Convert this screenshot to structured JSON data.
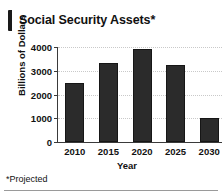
{
  "title": "Social Security Assets*",
  "footnote": "*Projected",
  "colors": {
    "bar": "#2b2b2b",
    "bar_edge": "#161616",
    "axis": "#3a3a3a",
    "grid": "#c9c9c9",
    "text": "#111111",
    "accent": "#1a1a1a",
    "background": "#ffffff"
  },
  "chart_data": {
    "type": "bar",
    "title": "Social Security Assets*",
    "xlabel": "Year",
    "ylabel": "Billions of Dollars",
    "categories": [
      "2010",
      "2015",
      "2020",
      "2025",
      "2030"
    ],
    "values": [
      2480,
      3330,
      3900,
      3230,
      1010
    ],
    "ylim": [
      0,
      4000
    ],
    "yticks": [
      0,
      1000,
      2000,
      3000,
      4000
    ],
    "ytick_labels": [
      "0",
      "1000",
      "2000",
      "3000",
      "4000"
    ],
    "grid": true,
    "legend": null,
    "note": "*Projected"
  }
}
